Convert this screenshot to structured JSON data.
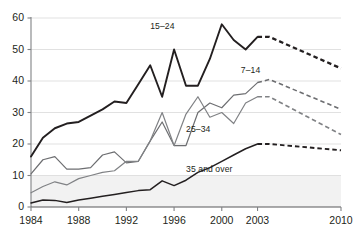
{
  "chart_data": {
    "type": "line",
    "title": "",
    "xlabel": "",
    "ylabel": "",
    "xlim": [
      1984,
      2010
    ],
    "ylim": [
      0,
      60
    ],
    "grid": true,
    "legend_position": "inline-labels",
    "x_ticks": [
      "1984",
      "1988",
      "1992",
      "1996",
      "2000",
      "2003",
      "2010"
    ],
    "x_tick_values": [
      1984,
      1988,
      1992,
      1996,
      2000,
      2003,
      2010
    ],
    "y_ticks": [
      "0",
      "10",
      "20",
      "30",
      "40",
      "50",
      "60"
    ],
    "y_tick_values": [
      0,
      10,
      20,
      30,
      40,
      50,
      60
    ],
    "shaded_band": {
      "from": 0,
      "to": 10,
      "color": "#f2f2f2"
    },
    "x": [
      1984,
      1985,
      1986,
      1987,
      1988,
      1989,
      1990,
      1991,
      1992,
      1993,
      1994,
      1995,
      1996,
      1997,
      1998,
      1999,
      2000,
      2001,
      2002,
      2003
    ],
    "x_projected": [
      2003,
      2004,
      2010
    ],
    "series": [
      {
        "name": "15–24",
        "label": "15–24",
        "color": "#231f20",
        "width": 1.9,
        "values": [
          16,
          22,
          25,
          26.5,
          27,
          29,
          31,
          33.5,
          33,
          39,
          45,
          35,
          50,
          38.5,
          38.5,
          47,
          58,
          53,
          50,
          54
        ],
        "projected_values": [
          54,
          54,
          44
        ]
      },
      {
        "name": "7–14",
        "label": "7–14",
        "color": "#6d6e71",
        "width": 1.2,
        "values": [
          10.5,
          15,
          16,
          12,
          12,
          12.5,
          16.5,
          17.5,
          14,
          14.5,
          21,
          27,
          19.5,
          19.5,
          30,
          33,
          31.5,
          35.5,
          36,
          39.5
        ],
        "projected_values": [
          39.5,
          40.5,
          31
        ]
      },
      {
        "name": "25–34",
        "label": "25–34",
        "color": "#808285",
        "width": 1.2,
        "values": [
          4.5,
          6.5,
          8,
          7,
          9,
          10,
          11,
          11.5,
          14.5,
          14.5,
          21,
          30,
          19.5,
          29.5,
          35,
          28.5,
          30,
          26.5,
          33,
          35
        ],
        "projected_values": [
          35,
          35,
          23
        ]
      },
      {
        "name": "35 and over",
        "label": "35 and over",
        "color": "#231f20",
        "width": 1.5,
        "values": [
          1.3,
          2.2,
          2.1,
          1.4,
          2.2,
          2.8,
          3.4,
          4,
          4.6,
          5.2,
          5.5,
          8.3,
          6.8,
          8.5,
          11,
          12.5,
          14.5,
          16.5,
          18.5,
          20
        ],
        "projected_values": [
          20,
          20,
          18
        ]
      }
    ],
    "series_label_positions": [
      {
        "label": "15–24",
        "x": 1994.0,
        "y": 57.0
      },
      {
        "label": "7–14",
        "x": 2001.6,
        "y": 43.2
      },
      {
        "label": "25–34",
        "x": 1997.0,
        "y": 24.5
      },
      {
        "label": "35 and over",
        "x": 1997.0,
        "y": 11.6
      }
    ]
  }
}
